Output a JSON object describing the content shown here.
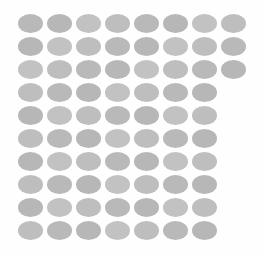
{
  "canvas": {
    "width": 266,
    "height": 256,
    "background_color": "#fefefe",
    "description": "Grid of gray ellipses"
  },
  "grid": {
    "rows": 10,
    "row_pitch": 23,
    "column_pitch": 29,
    "offset_x": 18,
    "offset_y": 14,
    "ellipse_width": 25,
    "ellipse_height": 19,
    "fill_color": "#b6b6b6",
    "row_counts": [
      8,
      8,
      8,
      7,
      7,
      7,
      7,
      7,
      7,
      7
    ],
    "total_count": 77
  },
  "shades": [
    "shade-a",
    "shade-b",
    "shade-c",
    "shade-d"
  ]
}
